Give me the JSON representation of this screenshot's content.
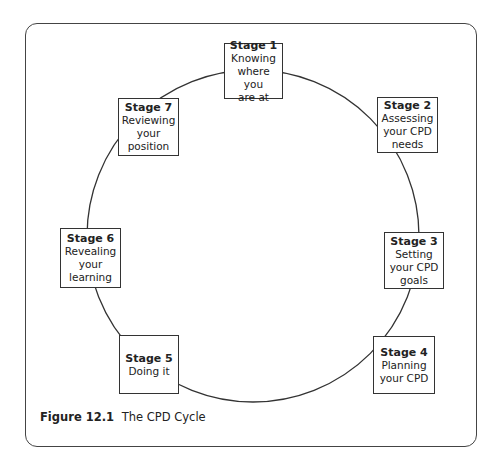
{
  "diagram": {
    "type": "cycle",
    "stages": [
      {
        "title": "Stage 1",
        "desc": "Knowing\nwhere you\nare at"
      },
      {
        "title": "Stage 2",
        "desc": "Assessing\nyour CPD\nneeds"
      },
      {
        "title": "Stage 3",
        "desc": "Setting\nyour CPD\ngoals"
      },
      {
        "title": "Stage 4",
        "desc": "Planning\nyour CPD"
      },
      {
        "title": "Stage 5",
        "desc": "Doing it"
      },
      {
        "title": "Stage 6",
        "desc": "Revealing\nyour\nlearning"
      },
      {
        "title": "Stage 7",
        "desc": "Reviewing\nyour\nposition"
      }
    ]
  },
  "caption": {
    "number": "Figure 12.1",
    "text": "The CPD Cycle"
  },
  "colors": {
    "stroke": "#333333",
    "background": "#ffffff"
  }
}
